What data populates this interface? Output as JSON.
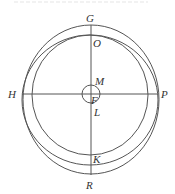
{
  "figure": {
    "type": "geometric-diagram",
    "stroke_color": "#555555",
    "label_color": "#333333",
    "labels": {
      "G": "G",
      "O": "O",
      "M": "M",
      "H": "H",
      "P": "P",
      "F": "F",
      "L": "L",
      "K": "K",
      "R": "R"
    },
    "circles": [
      {
        "name": "outer-circle",
        "cx": 91,
        "cy": 99.5,
        "rx": 68,
        "ry": 74.5
      },
      {
        "name": "middle-circle",
        "cx": 90,
        "cy": 100,
        "rx": 68,
        "ry": 65
      },
      {
        "name": "inner-circle",
        "cx": 90,
        "cy": 95,
        "rx": 58,
        "ry": 60
      },
      {
        "name": "center-small-circle",
        "cx": 91,
        "cy": 94,
        "r": 9
      }
    ],
    "lines": [
      {
        "name": "vertical-diameter-GR",
        "from": "G",
        "to": "R"
      },
      {
        "name": "horizontal-diameter-HP",
        "from": "H",
        "to": "P"
      }
    ]
  }
}
